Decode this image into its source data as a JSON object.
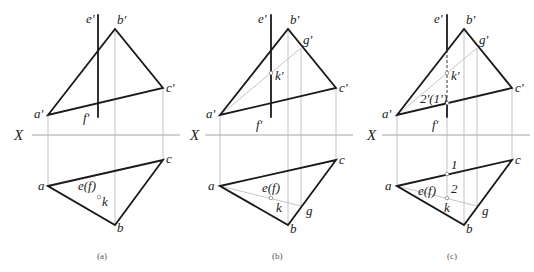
{
  "figure": {
    "axis_label": "X",
    "panels": [
      {
        "id": "a",
        "caption": "(a)",
        "labels": {
          "e_prime": "e'",
          "b_prime": "b'",
          "c_prime": "c'",
          "a_prime": "a'",
          "f_prime": "f'",
          "a": "a",
          "b": "b",
          "c": "c",
          "ef": "e(f)",
          "k": "k"
        }
      },
      {
        "id": "b",
        "caption": "(b)",
        "labels": {
          "e_prime": "e'",
          "b_prime": "b'",
          "g_prime": "g'",
          "k_prime": "k'",
          "c_prime": "c'",
          "a_prime": "a'",
          "f_prime": "f'",
          "a": "a",
          "b": "b",
          "c": "c",
          "ef": "e(f)",
          "k": "k",
          "g": "g"
        }
      },
      {
        "id": "c",
        "caption": "(c)",
        "labels": {
          "e_prime": "e'",
          "b_prime": "b'",
          "g_prime": "g'",
          "k_prime": "k'",
          "c_prime": "c'",
          "a_prime": "a'",
          "f_prime": "f'",
          "two_one_prime": "2'(1')",
          "a": "a",
          "b": "b",
          "c": "c",
          "ef": "e(f)",
          "k": "k",
          "g": "g",
          "one": "1",
          "two": "2"
        }
      }
    ]
  }
}
